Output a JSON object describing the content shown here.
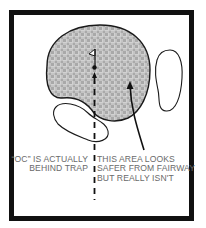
{
  "diagram": {
    "type": "golf-hole-green-layout",
    "elements": {
      "green": {
        "fill_pattern": "checkered-gray",
        "fill_color": "#bdbdbd",
        "pattern_light": "#e2e2e2",
        "outline": "#1a1a1a"
      },
      "flag": {
        "icon": "flag-icon"
      },
      "pin": {
        "icon": "pin-dot"
      },
      "line_of_play": {
        "style": "dashed"
      },
      "traps": [
        {
          "name": "right-trap",
          "outline": "#1a1a1a"
        },
        {
          "name": "left-trap",
          "outline": "#1a1a1a"
        }
      ],
      "arrow": {
        "icon": "arrow-up-icon"
      }
    },
    "annotations": {
      "left": {
        "lines": [
          "“OC” IS ACTUALLY",
          "BEHIND TRAP"
        ]
      },
      "right": {
        "lines": [
          "THIS AREA LOOKS",
          "SAFER FROM FAIRWAY",
          "BUT REALLY ISN'T"
        ]
      }
    },
    "colors": {
      "border": "#111111",
      "text": "#6a6a6a",
      "background": "#ffffff"
    }
  }
}
